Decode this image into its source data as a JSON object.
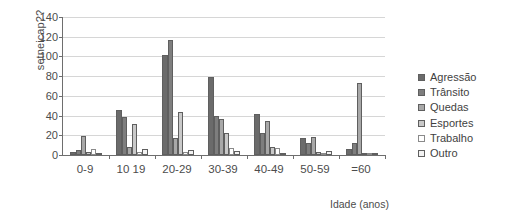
{
  "chart_data": {
    "type": "bar",
    "title": "",
    "xlabel": "Idade (anos)",
    "ylabel": "setneicap??",
    "categories": [
      "0-9",
      "10 19",
      "20-29",
      "30-39",
      "40-49",
      "50-59",
      "=60"
    ],
    "ylim": [
      0,
      140
    ],
    "yticks": [
      0,
      20,
      40,
      60,
      80,
      100,
      120,
      140
    ],
    "grid": true,
    "legend_position": "right",
    "series": [
      {
        "name": "Agressão",
        "color": "#6b6b6b",
        "values": [
          3,
          46,
          101,
          79,
          42,
          17,
          6
        ]
      },
      {
        "name": "Trânsito",
        "color": "#7e7e7e",
        "values": [
          5,
          39,
          117,
          40,
          22,
          12,
          12
        ]
      },
      {
        "name": "Quedas",
        "color": "#a8a8a8",
        "values": [
          19,
          8,
          17,
          37,
          35,
          18,
          73
        ]
      },
      {
        "name": "Esportes",
        "color": "#c9c9c9",
        "values": [
          3,
          31,
          44,
          22,
          8,
          3,
          2
        ]
      },
      {
        "name": "Trabalho",
        "color": "#ffffff",
        "values": [
          6,
          3,
          3,
          7,
          7,
          2,
          1
        ]
      },
      {
        "name": "Outro",
        "color": "#f2f2f2",
        "values": [
          2,
          6,
          5,
          4,
          2,
          4,
          1
        ]
      }
    ]
  }
}
